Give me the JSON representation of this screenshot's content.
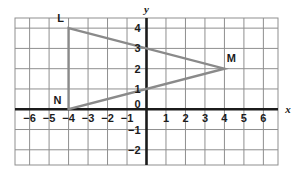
{
  "chart_data": {
    "type": "scatter",
    "title": "",
    "xlabel": "x",
    "ylabel": "y",
    "grid": true,
    "legend": false,
    "xlim": [
      -6.75,
      6.75
    ],
    "ylim": [
      -2.75,
      4.5
    ],
    "x_ticks": [
      -6,
      -5,
      -4,
      -3,
      -2,
      -1,
      1,
      2,
      3,
      4,
      5,
      6
    ],
    "x_tick_labels": [
      "−6",
      "−5",
      "−4",
      "−3",
      "−2",
      "−1",
      "1",
      "2",
      "3",
      "4",
      "5",
      "6"
    ],
    "y_ticks": [
      4,
      3,
      2,
      1,
      0,
      -1,
      -2
    ],
    "y_tick_labels": [
      "4",
      "3",
      "2",
      "1",
      "0",
      "−1",
      "−2"
    ],
    "origin_label": "0",
    "shapes": [
      {
        "name": "triangle-LMN",
        "type": "polygon",
        "closed": true,
        "stroke": "#8a8a8a",
        "points": [
          {
            "label": "L",
            "x": -4,
            "y": 4
          },
          {
            "label": "M",
            "x": 4,
            "y": 2
          },
          {
            "label": "N",
            "x": -4,
            "y": 0
          }
        ]
      }
    ],
    "vertex_labels": [
      {
        "label": "L",
        "x": -4,
        "y": 4,
        "dx": -8,
        "dy": -6
      },
      {
        "label": "M",
        "x": 4,
        "y": 2,
        "dx": 7,
        "dy": -7
      },
      {
        "label": "N",
        "x": -4,
        "y": 0,
        "dx": -11,
        "dy": -5
      }
    ]
  },
  "axes": {
    "x_name": "x",
    "y_name": "y"
  },
  "colors": {
    "grid_line": "#8f8f8f",
    "axis_line": "#1b1b1b",
    "shape_stroke": "#8a8a8a",
    "text": "#1b1b1b",
    "background": "#ffffff"
  }
}
